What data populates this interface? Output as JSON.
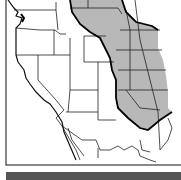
{
  "map": {
    "subject": "Western North America with shaded Great Plains region",
    "colors": {
      "background": "#ffffff",
      "shaded_region": "#b8b8b8",
      "lines": "#111111"
    },
    "legend_strip": "gray bar at bottom"
  }
}
